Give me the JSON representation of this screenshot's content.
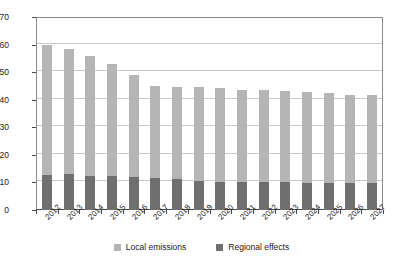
{
  "chart_data": {
    "type": "bar",
    "title": "",
    "subtitle": "",
    "xlabel": "",
    "ylabel": "",
    "stacked": true,
    "grid": true,
    "legend_position": "bottom",
    "ylim": [
      0,
      70
    ],
    "ytick_step": 10,
    "yticks": [
      0,
      10,
      20,
      30,
      40,
      50,
      60,
      70
    ],
    "categories": [
      "2012",
      "2013",
      "2014",
      "2015",
      "2016",
      "2017",
      "2018",
      "2019",
      "2020",
      "2021",
      "2022",
      "2023",
      "2024",
      "2025",
      "2026",
      "2027"
    ],
    "series": [
      {
        "name": "Regional effects",
        "color": "#6f6f6f",
        "values": [
          12.7,
          12.9,
          12.5,
          12.3,
          12.0,
          11.6,
          11.4,
          10.6,
          10.3,
          10.2,
          10.1,
          10.0,
          9.9,
          9.8,
          9.8,
          9.7
        ]
      },
      {
        "name": "Local emissions",
        "color": "#b5b5b5",
        "values": [
          47.3,
          45.6,
          43.5,
          40.7,
          37.0,
          33.4,
          33.3,
          33.9,
          34.0,
          33.5,
          33.4,
          33.0,
          32.8,
          32.5,
          32.0,
          32.0
        ]
      }
    ],
    "totals": [
      60.0,
      58.5,
      56.0,
      53.0,
      49.0,
      45.0,
      44.7,
      44.5,
      44.3,
      43.7,
      43.5,
      43.0,
      42.7,
      42.3,
      41.8,
      41.7
    ]
  },
  "legend": {
    "items": [
      {
        "label": "Local emissions",
        "color": "#b5b5b5"
      },
      {
        "label": "Regional effects",
        "color": "#6f6f6f"
      }
    ]
  }
}
